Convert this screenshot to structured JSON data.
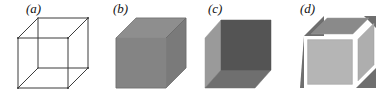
{
  "figure": {
    "caption_present": false,
    "background_color": "#ffffff",
    "panel_count": 4
  },
  "panels": [
    {
      "id": "a",
      "label": "(a)",
      "label_x": 26,
      "label_y": 1,
      "cube_type": "wireframe",
      "description": "transparent wireframe Necker cube",
      "line_color": "#3b3b3b",
      "line_width": 1,
      "fill": "none",
      "origin_x": 14,
      "origin_y": 16,
      "front_x": 4,
      "front_y": 22,
      "size": 50,
      "depth_x": 20,
      "depth_y": 20
    },
    {
      "id": "b",
      "label": "(b)",
      "label_x": 113,
      "label_y": 1,
      "cube_type": "solid-uniform",
      "description": "opaque cube with uniform grey faces",
      "face_front": "#848484",
      "face_top": "#8e8e8e",
      "face_side": "#7a7a7a",
      "outline_color": "#6a6a6a",
      "origin_x": 112,
      "origin_y": 16,
      "front_x": 4,
      "front_y": 22,
      "size": 50,
      "depth_x": 20,
      "depth_y": 20
    },
    {
      "id": "c",
      "label": "(c)",
      "label_x": 208,
      "label_y": 1,
      "cube_type": "solid-shaded",
      "description": "opaque cube with distinct luminance per face, viewed from below-left",
      "face_front": "#545454",
      "face_left": "#9a9a9a",
      "face_bottom": "#6f6f6f",
      "outline_color": "#4a4a4a",
      "origin_x": 205,
      "origin_y": 16,
      "front_x": 16,
      "front_y": 4,
      "size": 50,
      "depth_x": -16,
      "depth_y": 18
    },
    {
      "id": "d",
      "label": "(d)",
      "label_x": 300,
      "label_y": 1,
      "cube_type": "skeletal-inset",
      "description": "cube with thick white edge bands separating inset grey face panels, dark triangular corners visible behind",
      "face_front": "#b5b5b5",
      "face_top": "#8a8a8a",
      "face_side": "#aeaeae",
      "face_bottom": "#b0b0b0",
      "corner_dark": "#6e6e6e",
      "band_color": "#ffffff",
      "band_width": 3,
      "origin_x": 298,
      "origin_y": 16,
      "front_x": 6,
      "front_y": 20,
      "size": 52,
      "depth_x": 20,
      "depth_y": 20
    }
  ]
}
